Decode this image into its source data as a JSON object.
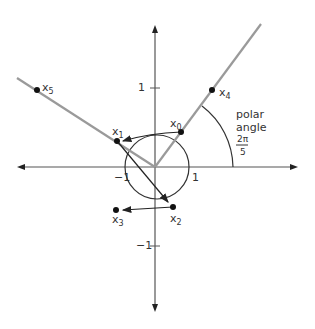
{
  "axes": {
    "tick_labels": {
      "x_pos": "1",
      "x_neg": "−1",
      "y_pos": "1",
      "y_neg": "−1"
    }
  },
  "points": [
    {
      "name": "x",
      "sub": "0"
    },
    {
      "name": "x",
      "sub": "1"
    },
    {
      "name": "x",
      "sub": "2"
    },
    {
      "name": "x",
      "sub": "3"
    },
    {
      "name": "x",
      "sub": "4"
    },
    {
      "name": "x",
      "sub": "5"
    }
  ],
  "annotation": {
    "line1": "polar",
    "line2": "angle",
    "frac_num": "2π",
    "frac_den": "5"
  },
  "colors": {
    "axis": "#444444",
    "ray": "#9a9a9a",
    "ink": "#222222"
  }
}
